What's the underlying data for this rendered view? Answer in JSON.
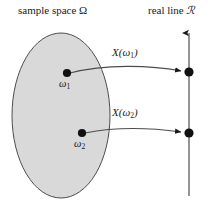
{
  "figure": {
    "width": 214,
    "height": 206,
    "background": "#ffffff",
    "ink_color": "#1a1a1a",
    "ellipse_fill": "#d9d9d9",
    "ellipse_stroke": "#4d4d4d"
  },
  "labels": {
    "sample_space": "sample space Ω",
    "real_line_prefix": "real line ",
    "real_line_symbol": "ℛ"
  },
  "sample_space": {
    "name": "sample space Ω",
    "points": [
      {
        "id": "omega1",
        "label": "ω",
        "subscript": "1",
        "x": 67,
        "y": 73
      },
      {
        "id": "omega2",
        "label": "ω",
        "subscript": "2",
        "x": 82,
        "y": 133
      }
    ]
  },
  "real_line": {
    "axis_x": 189,
    "top_y": 30,
    "bottom_y": 196,
    "arrowhead": "up",
    "points": [
      {
        "id": "image1",
        "x": 189,
        "y": 72
      },
      {
        "id": "image2",
        "x": 189,
        "y": 133
      }
    ]
  },
  "mappings": [
    {
      "id": "map1",
      "label_function": "X",
      "label_open": "(",
      "label_arg": "ω",
      "label_subscript": "1",
      "label_close": ")",
      "from": "omega1",
      "to": "image1"
    },
    {
      "id": "map2",
      "label_function": "X",
      "label_open": "(",
      "label_arg": "ω",
      "label_subscript": "2",
      "label_close": ")",
      "from": "omega2",
      "to": "image2"
    }
  ]
}
